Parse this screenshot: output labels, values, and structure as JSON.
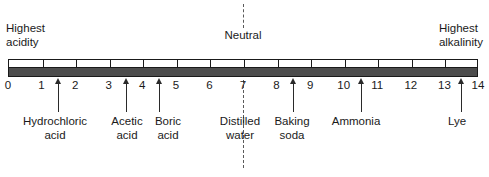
{
  "figure": {
    "axis_min": 0,
    "axis_max": 14,
    "colors": {
      "bar_fill": "#4d4d4d",
      "outline": "#1a1a1a",
      "text": "#1a1a1a",
      "dashed_line": "#5a5a5a"
    }
  },
  "captions": {
    "acidity": "Highest\nacidity",
    "alkalinity": "Highest\nalkalinity",
    "neutral": "Neutral"
  },
  "neutral": {
    "value": 7
  },
  "chart_data": {
    "type": "scale",
    "xlabel": "pH",
    "xlim": [
      0,
      14
    ],
    "tick_values": [
      0,
      1,
      2,
      3,
      4,
      5,
      6,
      7,
      8,
      9,
      10,
      11,
      12,
      13,
      14
    ],
    "tick_labels": [
      "0",
      "1",
      "2",
      "3",
      "4",
      "5",
      "6",
      "7",
      "8",
      "9",
      "10",
      "11",
      "12",
      "13",
      "14"
    ],
    "annotations": [
      {
        "label": "Highest\nacidity",
        "value": 0,
        "position": "above-left"
      },
      {
        "label": "Neutral",
        "value": 7,
        "position": "above"
      },
      {
        "label": "Highest\nalkalinity",
        "value": 14,
        "position": "above-right"
      }
    ],
    "markers": [
      {
        "label": "Hydrochloric\nacid",
        "value": 1.5
      },
      {
        "label": "Acetic\nacid",
        "value": 3.5
      },
      {
        "label": "Boric\nacid",
        "value": 4.5
      },
      {
        "label": "Distilled\nwater",
        "value": 7
      },
      {
        "label": "Baking\nsoda",
        "value": 8.5
      },
      {
        "label": "Ammonia",
        "value": 10.5
      },
      {
        "label": "Lye",
        "value": 13.5
      }
    ]
  },
  "markers": [
    {
      "name": "hydrochloric-acid",
      "label": "Hydrochloric\nacid",
      "value": 1.5,
      "label_x": 55,
      "arrow": true
    },
    {
      "name": "acetic-acid",
      "label": "Acetic\nacid",
      "value": 3.5,
      "label_x": 127,
      "arrow": true
    },
    {
      "name": "boric-acid",
      "label": "Boric\nacid",
      "value": 4.5,
      "label_x": 168,
      "arrow": true
    },
    {
      "name": "distilled-water",
      "label": "Distilled\nwater",
      "value": 7,
      "label_x": 240,
      "arrow": false
    },
    {
      "name": "baking-soda",
      "label": "Baking\nsoda",
      "value": 8.5,
      "label_x": 292,
      "arrow": true
    },
    {
      "name": "ammonia",
      "label": "Ammonia",
      "value": 10.5,
      "label_x": 356,
      "arrow": true
    },
    {
      "name": "lye",
      "label": "Lye",
      "value": 13.5,
      "label_x": 457,
      "arrow": true
    }
  ]
}
